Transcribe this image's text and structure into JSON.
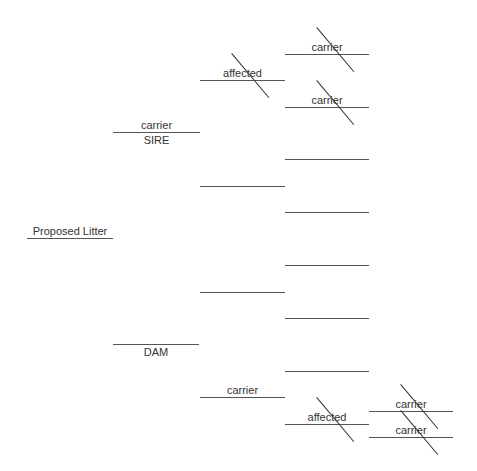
{
  "colors": {
    "line": "#555555",
    "text": "#333333",
    "background": "#ffffff"
  },
  "litter": {
    "label": "Proposed Litter"
  },
  "sire": {
    "role_label": "SIRE",
    "status": "carrier"
  },
  "dam": {
    "role_label": "DAM",
    "status": ""
  },
  "slots": [
    {
      "id": "litter",
      "gen": 1,
      "x": 27,
      "y": 238,
      "w": 86,
      "above": "Proposed Litter",
      "below": "",
      "struck": false
    },
    {
      "id": "sire",
      "gen": 2,
      "x": 113,
      "y": 132,
      "w": 87,
      "above": "carrier",
      "below": "SIRE",
      "struck": false
    },
    {
      "id": "dam",
      "gen": 2,
      "x": 113,
      "y": 344,
      "w": 86,
      "above": "",
      "below": "DAM",
      "struck": false
    },
    {
      "id": "sire-sire",
      "gen": 3,
      "x": 200,
      "y": 80,
      "w": 85,
      "above": "affected",
      "below": "",
      "struck": true
    },
    {
      "id": "sire-dam",
      "gen": 3,
      "x": 200,
      "y": 186,
      "w": 85,
      "above": "",
      "below": "",
      "struck": false
    },
    {
      "id": "dam-sire",
      "gen": 3,
      "x": 200,
      "y": 292,
      "w": 85,
      "above": "",
      "below": "",
      "struck": false
    },
    {
      "id": "dam-dam",
      "gen": 3,
      "x": 200,
      "y": 397,
      "w": 85,
      "above": "carrier",
      "below": "",
      "struck": false
    },
    {
      "id": "ss-sire",
      "gen": 4,
      "x": 285,
      "y": 54,
      "w": 84,
      "above": "carrier",
      "below": "",
      "struck": true
    },
    {
      "id": "ss-dam",
      "gen": 4,
      "x": 285,
      "y": 107,
      "w": 84,
      "above": "carrier",
      "below": "",
      "struck": true
    },
    {
      "id": "sd-sire",
      "gen": 4,
      "x": 285,
      "y": 159,
      "w": 84,
      "above": "",
      "below": "",
      "struck": false
    },
    {
      "id": "sd-dam",
      "gen": 4,
      "x": 285,
      "y": 212,
      "w": 84,
      "above": "",
      "below": "",
      "struck": false
    },
    {
      "id": "ds-sire",
      "gen": 4,
      "x": 285,
      "y": 265,
      "w": 84,
      "above": "",
      "below": "",
      "struck": false
    },
    {
      "id": "ds-dam",
      "gen": 4,
      "x": 285,
      "y": 318,
      "w": 84,
      "above": "",
      "below": "",
      "struck": false
    },
    {
      "id": "dd-sire",
      "gen": 4,
      "x": 285,
      "y": 371,
      "w": 84,
      "above": "",
      "below": "",
      "struck": false
    },
    {
      "id": "dd-dam",
      "gen": 4,
      "x": 285,
      "y": 424,
      "w": 84,
      "above": "affected",
      "below": "",
      "struck": true
    },
    {
      "id": "ddd-sire",
      "gen": 5,
      "x": 369,
      "y": 411,
      "w": 84,
      "above": "carrier",
      "below": "",
      "struck": true
    },
    {
      "id": "ddd-dam",
      "gen": 5,
      "x": 369,
      "y": 437,
      "w": 84,
      "above": "carrier",
      "below": "",
      "struck": true
    }
  ]
}
